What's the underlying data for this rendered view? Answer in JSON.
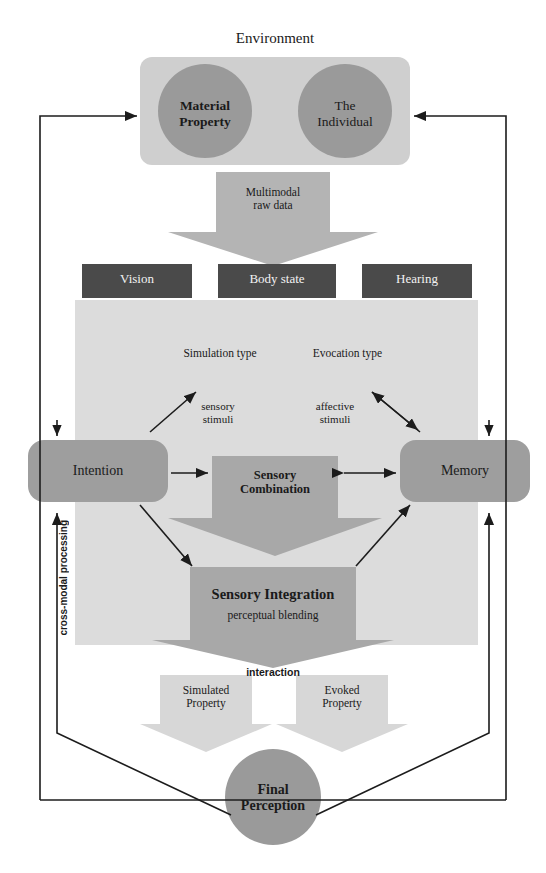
{
  "diagram": {
    "title": "Environment",
    "environment": {
      "label": "Environment",
      "nodes": [
        {
          "id": "material-property",
          "label": "Material\nProperty",
          "line1": "Material",
          "line2": "Property"
        },
        {
          "id": "the-individual",
          "label": "The\nIndividual",
          "line1": "The",
          "line2": "Individual"
        }
      ]
    },
    "multimodal_arrow": {
      "line1": "Multimodal",
      "line2": "raw data"
    },
    "sensory_channels": [
      {
        "id": "vision",
        "label": "Vision"
      },
      {
        "id": "body-state",
        "label": "Body state"
      },
      {
        "id": "hearing",
        "label": "Hearing"
      }
    ],
    "processing_types": [
      {
        "id": "simulation-type",
        "label": "Simulation type"
      },
      {
        "id": "evocation-type",
        "label": "Evocation type"
      }
    ],
    "stimuli": [
      {
        "id": "sensory-stimuli",
        "line1": "sensory",
        "line2": "stimuli"
      },
      {
        "id": "affective-stimuli",
        "line1": "affective",
        "line2": "stimuli"
      }
    ],
    "intention": {
      "label": "Intention"
    },
    "memory": {
      "label": "Memory"
    },
    "sensory_combination": {
      "line1": "Sensory",
      "line2": "Combination"
    },
    "sensory_integration": {
      "title": "Sensory  Integration",
      "subtitle": "perceptual blending"
    },
    "cross_modal": {
      "label": "cross-modal processing"
    },
    "interaction": {
      "label": "interaction"
    },
    "properties": [
      {
        "id": "simulated-property",
        "line1": "Simulated",
        "line2": "Property"
      },
      {
        "id": "evoked-property",
        "line1": "Evoked",
        "line2": "Property"
      }
    ],
    "final_perception": {
      "line1": "Final",
      "line2": "Perception"
    },
    "colors": {
      "panel_light": "#dcdcdc",
      "panel_env": "#cfcfcf",
      "circle": "#9a9a9a",
      "dark_box": "#4a4a4a",
      "round_box": "#9e9e9e",
      "gray_box": "#a8a8a8",
      "arrow_fill": "#b4b4b4",
      "line": "#1c1c1c"
    }
  }
}
